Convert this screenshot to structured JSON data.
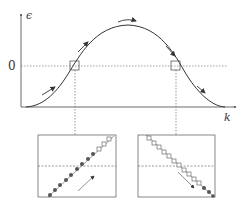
{
  "diagram": {
    "y_axis_label": "ϵ",
    "x_axis_label": "k",
    "zero_label": "0",
    "curve": "Gaussian-shaped band ϵ(k) with single maximum",
    "arrows_on_curve": [
      "rising-left-low",
      "rising-left-mid",
      "over-peak",
      "falling-right-mid",
      "falling-right-low"
    ],
    "markers": [
      {
        "name": "left-crossing",
        "x": 75,
        "y": 66
      },
      {
        "name": "right-crossing",
        "x": 176,
        "y": 66
      }
    ],
    "insets": [
      {
        "name": "left-inset",
        "slope": "rising",
        "filled_points": 9,
        "open_points": 3,
        "arrow": "up-right"
      },
      {
        "name": "right-inset",
        "slope": "falling",
        "filled_points": 3,
        "open_points": 11,
        "arrow": "down-right"
      }
    ],
    "colors": {
      "line": "#333333",
      "dotted": "#555555",
      "filled_point": "#555555",
      "open_point": "#ffffff"
    }
  }
}
